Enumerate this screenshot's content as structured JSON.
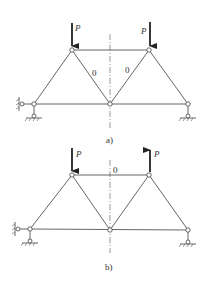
{
  "figures": [
    {
      "caption": "a)",
      "load_label_left": "P",
      "load_label_right": "P",
      "left_load_direction": "down",
      "right_load_direction": "down",
      "zero_labels": [
        "0",
        "0"
      ]
    },
    {
      "caption": "b)",
      "load_label_left": "P",
      "load_label_right": "P",
      "left_load_direction": "down",
      "right_load_direction": "up",
      "zero_labels": [
        "0"
      ]
    }
  ],
  "colors": {
    "line": "#555555",
    "arrow": "#222222"
  }
}
